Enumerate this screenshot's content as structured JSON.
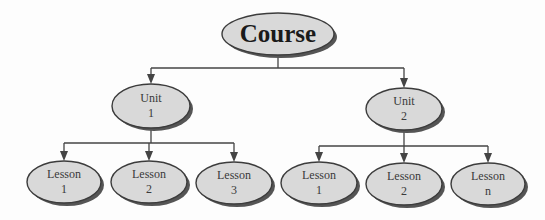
{
  "diagram": {
    "title": "Course",
    "colors": {
      "fill": "#d9d9d9",
      "stroke": "#3c3c3c",
      "shadow": "#555555",
      "line": "#444444",
      "background": "#fdfdfd"
    },
    "root": {
      "label": "Course",
      "cx": 278,
      "cy": 34,
      "rx": 56,
      "ry": 21
    },
    "units": [
      {
        "line1": "Unit",
        "line2": "1",
        "cx": 151,
        "cy": 106,
        "rx": 39,
        "ry": 22,
        "lessons": [
          {
            "line1": "Lesson",
            "line2": "1",
            "cx": 64,
            "cy": 182,
            "rx": 37,
            "ry": 21
          },
          {
            "line1": "Lesson",
            "line2": "2",
            "cx": 149,
            "cy": 182,
            "rx": 38,
            "ry": 21
          },
          {
            "line1": "Lesson",
            "line2": "3",
            "cx": 234,
            "cy": 183,
            "rx": 38,
            "ry": 21
          }
        ]
      },
      {
        "line1": "Unit",
        "line2": "2",
        "cx": 404,
        "cy": 109,
        "rx": 38,
        "ry": 21,
        "lessons": [
          {
            "line1": "Lesson",
            "line2": "1",
            "cx": 319,
            "cy": 183,
            "rx": 38,
            "ry": 21
          },
          {
            "line1": "Lesson",
            "line2": "2",
            "cx": 404,
            "cy": 184,
            "rx": 38,
            "ry": 21
          },
          {
            "line1": "Lesson",
            "line2": "n",
            "cx": 488,
            "cy": 184,
            "rx": 37,
            "ry": 21
          }
        ]
      }
    ]
  }
}
